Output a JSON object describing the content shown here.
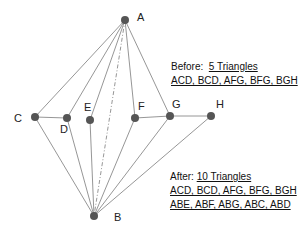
{
  "points": {
    "A": {
      "label": "A",
      "x": 125,
      "y": 20
    },
    "B": {
      "label": "B",
      "x": 94,
      "y": 216
    },
    "C": {
      "label": "C",
      "x": 35,
      "y": 117
    },
    "D": {
      "label": "D",
      "x": 67,
      "y": 118
    },
    "E": {
      "label": "E",
      "x": 90,
      "y": 120
    },
    "F": {
      "label": "F",
      "x": 135,
      "y": 118
    },
    "G": {
      "label": "G",
      "x": 170,
      "y": 116
    },
    "H": {
      "label": "H",
      "x": 211,
      "y": 116
    }
  },
  "colors": {
    "line": "#8a8a8a",
    "point": "#555555",
    "text": "#111111"
  },
  "before": {
    "prefix": "Before:",
    "count": "5 Triangles",
    "list": "ACD, BCD, AFG, BFG, BGH"
  },
  "after": {
    "prefix": "After:",
    "count": "10 Triangles",
    "list1": "ACD, BCD, AFG, BFG, BGH",
    "list2": "ABE, ABF, ABG, ABC, ABD"
  }
}
